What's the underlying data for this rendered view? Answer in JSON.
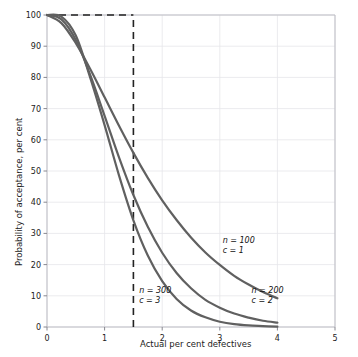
{
  "chart_data": {
    "type": "line",
    "title": "",
    "xlabel": "Actual per cent defectives",
    "ylabel": "Probability of acceptance, per cent",
    "xlim": [
      0,
      5
    ],
    "ylim": [
      0,
      100
    ],
    "xticks": [
      0,
      1,
      2,
      3,
      4,
      5
    ],
    "yticks": [
      0,
      10,
      20,
      30,
      40,
      50,
      60,
      70,
      80,
      90,
      100
    ],
    "grid": true,
    "legend_position": "inline-annotations",
    "series": [
      {
        "name": "n = 100, c = 1",
        "label_line1": "n = 100",
        "label_line2": "c = 1",
        "color": "#606060",
        "x": [
          0.0,
          0.25,
          0.5,
          0.75,
          1.0,
          1.25,
          1.5,
          1.75,
          2.0,
          2.25,
          2.5,
          2.75,
          3.0,
          3.25,
          3.5,
          3.75,
          4.0
        ],
        "y": [
          100.0,
          97.4,
          91.0,
          82.7,
          73.6,
          64.5,
          55.8,
          47.8,
          40.6,
          34.3,
          28.7,
          23.9,
          19.9,
          16.4,
          13.6,
          11.2,
          9.2
        ]
      },
      {
        "name": "n = 200, c = 2",
        "label_line1": "n = 200",
        "label_line2": "c = 2",
        "color": "#606060",
        "x": [
          0.0,
          0.25,
          0.5,
          0.75,
          1.0,
          1.25,
          1.5,
          1.75,
          2.0,
          2.25,
          2.5,
          2.75,
          3.0,
          3.25,
          3.5,
          3.75,
          4.0
        ],
        "y": [
          100.0,
          98.6,
          92.0,
          80.8,
          67.7,
          54.4,
          42.3,
          32.1,
          23.8,
          17.3,
          12.4,
          8.7,
          6.2,
          4.3,
          3.0,
          2.0,
          1.4
        ]
      },
      {
        "name": "n = 300, c = 3",
        "label_line1": "n = 300",
        "label_line2": "c = 3",
        "color": "#606060",
        "x": [
          0.0,
          0.25,
          0.5,
          0.75,
          1.0,
          1.25,
          1.5,
          1.75,
          2.0,
          2.25,
          2.5,
          2.75,
          3.0,
          3.25,
          3.5,
          3.75,
          4.0
        ],
        "y": [
          100.0,
          99.5,
          93.4,
          79.9,
          64.7,
          48.6,
          34.2,
          22.9,
          14.7,
          9.0,
          5.3,
          3.1,
          1.7,
          0.9,
          0.5,
          0.3,
          0.1
        ]
      }
    ],
    "reference_lines": [
      {
        "name": "aql-vertical",
        "orientation": "vertical",
        "x": 1.5,
        "y_from": 0,
        "y_to": 100,
        "style": "dashed",
        "color": "#222222"
      },
      {
        "name": "aql-horizontal",
        "orientation": "horizontal",
        "y": 100,
        "x_from": 0,
        "x_to": 1.5,
        "style": "dashed",
        "color": "#222222"
      }
    ],
    "annotations": [
      {
        "text_line1": "n = 100",
        "text_line2": "c = 1",
        "x": 3.05,
        "y": 27
      },
      {
        "text_line1": "n = 200",
        "text_line2": "c = 2",
        "x": 3.55,
        "y": 11
      },
      {
        "text_line1": "n = 300",
        "text_line2": "c = 3",
        "x": 1.6,
        "y": 11
      }
    ]
  }
}
